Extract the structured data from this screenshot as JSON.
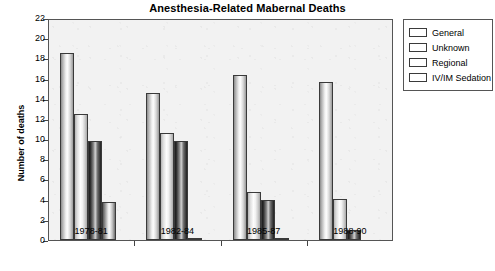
{
  "chart_data": {
    "type": "bar",
    "title": "Anesthesia-Related Mabernal Deaths",
    "xlabel": "",
    "ylabel": "Number of deaths",
    "ylim": [
      0,
      22
    ],
    "ytick_step": 2,
    "yticks": [
      0,
      2,
      4,
      6,
      8,
      10,
      12,
      14,
      16,
      18,
      20,
      22
    ],
    "grid": false,
    "legend_position": "right",
    "categories": [
      "1978-81",
      "1982-84",
      "1985-87",
      "1988-90"
    ],
    "series": [
      {
        "name": "General",
        "values": [
          18.5,
          14.6,
          16.4,
          15.7
        ]
      },
      {
        "name": "Unknown",
        "values": [
          12.5,
          10.6,
          4.8,
          4.1
        ]
      },
      {
        "name": "Regional",
        "values": [
          9.8,
          9.8,
          4.0,
          1.0
        ]
      },
      {
        "name": "IV/IM Sedation",
        "values": [
          3.8,
          0.1,
          0.1,
          0.0
        ]
      }
    ]
  },
  "legend": {
    "items": [
      {
        "label": "General"
      },
      {
        "label": "Unknown"
      },
      {
        "label": "Regional"
      },
      {
        "label": "IV/IM Sedation"
      }
    ]
  }
}
